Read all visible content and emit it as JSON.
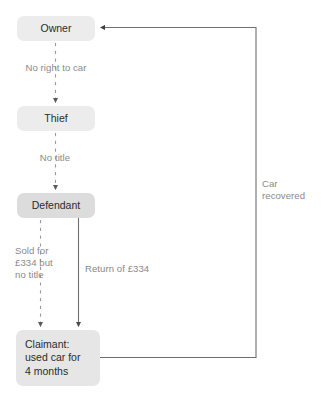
{
  "diagram": {
    "width": 323,
    "height": 400,
    "background_color": "#ffffff",
    "node_fill_color": "#e6e6e6",
    "node_text_color": "#2b2b2b",
    "edge_label_color": "#8a8a8a",
    "edge_line_color": "#6e6e6e",
    "dashed_line_color": "#9a9a9a",
    "nodes": [
      {
        "id": "owner",
        "label": "Owner"
      },
      {
        "id": "thief",
        "label": "Thief"
      },
      {
        "id": "defendant",
        "label": "Defendant"
      },
      {
        "id": "claimant",
        "label": "Claimant:\nused car for\n4 months"
      }
    ],
    "edge_labels": [
      {
        "id": "no-right-to-car",
        "text": "No right to car"
      },
      {
        "id": "no-title",
        "text": "No title"
      },
      {
        "id": "sold-for",
        "text": "Sold for\n£334 but\nno title"
      },
      {
        "id": "return-of-334",
        "text": "Return of £334"
      },
      {
        "id": "car-recovered",
        "text": "Car\nrecovered"
      }
    ],
    "edges": [
      {
        "id": "owner-to-thief",
        "from": "owner",
        "to": "thief",
        "style": "dashed",
        "label": "No right to car"
      },
      {
        "id": "thief-to-defendant",
        "from": "thief",
        "to": "defendant",
        "style": "dashed",
        "label": "No title"
      },
      {
        "id": "defendant-to-claimant-sale",
        "from": "defendant",
        "to": "claimant",
        "style": "dashed",
        "label": "Sold for £334 but no title"
      },
      {
        "id": "defendant-to-claimant-return",
        "from": "defendant",
        "to": "claimant",
        "style": "solid",
        "label": "Return of £334"
      },
      {
        "id": "claimant-to-owner",
        "from": "claimant",
        "to": "owner",
        "style": "solid",
        "label": "Car recovered"
      }
    ]
  }
}
